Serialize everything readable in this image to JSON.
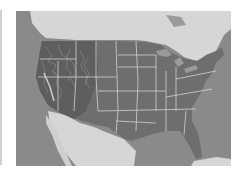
{
  "map": {
    "subject": "Contiguous United States shaded relief with state boundaries",
    "style": "grayscale",
    "colors": {
      "ocean": "#8a8a8a",
      "foreign_land": "#d6d6d6",
      "us_land": "#6e6e6e",
      "mountains": "#5a5a5a",
      "borders": "#e0e0e0",
      "frame_edge": "#d0d0d0"
    }
  }
}
